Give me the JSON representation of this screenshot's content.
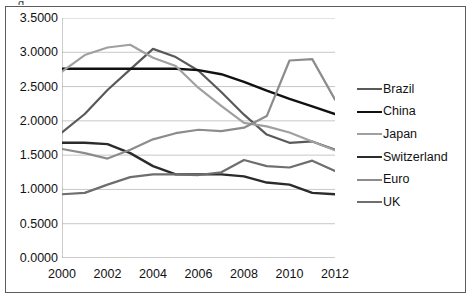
{
  "figure": {
    "background_color": "#ffffff",
    "border_color": "#5c5c5c",
    "cropped_title_fragment": "g"
  },
  "chart_data": {
    "type": "line",
    "title": "",
    "subtitle": "",
    "xlabel": "",
    "ylabel": "",
    "x": [
      2000,
      2001,
      2002,
      2003,
      2004,
      2005,
      2006,
      2007,
      2008,
      2009,
      2010,
      2011,
      2012
    ],
    "xlim": [
      2000,
      2012
    ],
    "ylim": [
      0.0,
      3.5
    ],
    "xtick_labels": [
      "2000",
      "2002",
      "2004",
      "2006",
      "2008",
      "2010",
      "2012"
    ],
    "xtick_values": [
      2000,
      2002,
      2004,
      2006,
      2008,
      2010,
      2012
    ],
    "ytick_labels": [
      "0.0000",
      "0.5000",
      "1.0000",
      "1.5000",
      "2.0000",
      "2.5000",
      "3.0000",
      "3.5000"
    ],
    "ytick_values": [
      0.0,
      0.5,
      1.0,
      1.5,
      2.0,
      2.5,
      3.0,
      3.5
    ],
    "grid": "horizontal",
    "grid_color": "#b9b9b9",
    "legend_position": "right",
    "series": [
      {
        "name": "Brazil",
        "color": "#595959",
        "width": 2.2,
        "values": [
          1.83,
          2.1,
          2.45,
          2.75,
          3.05,
          2.93,
          2.73,
          2.42,
          2.09,
          1.8,
          1.68,
          1.7,
          1.58
        ]
      },
      {
        "name": "China",
        "color": "#111111",
        "width": 2.4,
        "values": [
          2.76,
          2.76,
          2.76,
          2.76,
          2.76,
          2.76,
          2.74,
          2.68,
          2.57,
          2.44,
          2.32,
          2.21,
          2.1
        ]
      },
      {
        "name": "Japan",
        "color": "#a0a0a0",
        "width": 2.2,
        "values": [
          2.72,
          2.96,
          3.07,
          3.11,
          2.92,
          2.8,
          2.48,
          2.22,
          1.97,
          1.92,
          1.83,
          1.7,
          1.57
        ]
      },
      {
        "name": "Switzerland",
        "color": "#2b2b2b",
        "width": 2.4,
        "values": [
          1.68,
          1.68,
          1.66,
          1.53,
          1.34,
          1.22,
          1.22,
          1.22,
          1.19,
          1.1,
          1.07,
          0.95,
          0.93
        ]
      },
      {
        "name": "Euro",
        "color": "#8c8c8c",
        "width": 2.2,
        "values": [
          1.59,
          1.53,
          1.45,
          1.58,
          1.73,
          1.82,
          1.87,
          1.85,
          1.9,
          2.07,
          2.88,
          2.9,
          2.31
        ]
      },
      {
        "name": "UK",
        "color": "#6e6e6e",
        "width": 2.2,
        "values": [
          0.93,
          0.95,
          1.07,
          1.18,
          1.22,
          1.22,
          1.21,
          1.25,
          1.43,
          1.34,
          1.32,
          1.42,
          1.27
        ]
      }
    ]
  },
  "legend": {
    "items": [
      {
        "label": "Brazil",
        "color": "#595959",
        "width": 2.2
      },
      {
        "label": "China",
        "color": "#111111",
        "width": 2.6
      },
      {
        "label": "Japan",
        "color": "#a0a0a0",
        "width": 2.2
      },
      {
        "label": "Switzerland",
        "color": "#2b2b2b",
        "width": 2.6
      },
      {
        "label": "Euro",
        "color": "#8c8c8c",
        "width": 2.2
      },
      {
        "label": "UK",
        "color": "#6e6e6e",
        "width": 2.2
      }
    ]
  }
}
